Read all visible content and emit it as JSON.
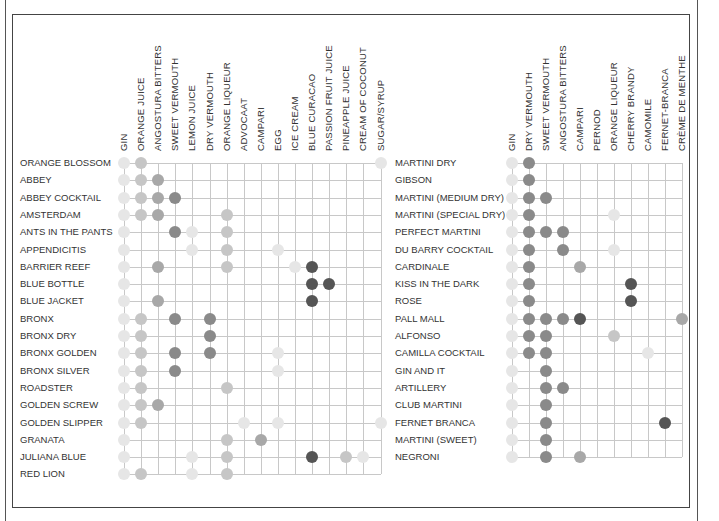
{
  "chart_data": [
    {
      "type": "heatmap",
      "title": "",
      "xlabel": "Ingredients",
      "ylabel": "Cocktails",
      "grid": true,
      "columns": [
        "GIN",
        "ORANGE JUICE",
        "ANGOSTURA BITTERS",
        "SWEET VERMOUTH",
        "LEMON JUICE",
        "DRY VERMOUTH",
        "ORANGE LIQUEUR",
        "ADVOCAAT",
        "CAMPARI",
        "EGG",
        "ICE CREAM",
        "BLUE CURACAO",
        "PASSION FRUIT JUICE",
        "PINEAPPLE JUICE",
        "CREAM OF COCONUT",
        "SUGAR/SYRUP"
      ],
      "rows": [
        {
          "label": "ORANGE BLOSSOM",
          "dots": [
            [
              0,
              1
            ],
            [
              1,
              2
            ],
            [
              15,
              1
            ]
          ]
        },
        {
          "label": "ABBEY",
          "dots": [
            [
              0,
              1
            ],
            [
              1,
              2
            ],
            [
              2,
              3
            ]
          ]
        },
        {
          "label": "ABBEY COCKTAIL",
          "dots": [
            [
              0,
              1
            ],
            [
              1,
              2
            ],
            [
              2,
              3
            ],
            [
              3,
              4
            ]
          ]
        },
        {
          "label": "AMSTERDAM",
          "dots": [
            [
              0,
              1
            ],
            [
              1,
              2
            ],
            [
              2,
              3
            ],
            [
              6,
              2
            ]
          ]
        },
        {
          "label": "ANTS IN THE PANTS",
          "dots": [
            [
              0,
              1
            ],
            [
              3,
              4
            ],
            [
              4,
              1
            ],
            [
              6,
              2
            ]
          ]
        },
        {
          "label": "APPENDICITIS",
          "dots": [
            [
              0,
              1
            ],
            [
              4,
              1
            ],
            [
              6,
              2
            ],
            [
              9,
              1
            ]
          ]
        },
        {
          "label": "BARRIER REEF",
          "dots": [
            [
              0,
              1
            ],
            [
              2,
              3
            ],
            [
              6,
              2
            ],
            [
              10,
              1
            ],
            [
              11,
              5
            ]
          ]
        },
        {
          "label": "BLUE BOTTLE",
          "dots": [
            [
              0,
              1
            ],
            [
              11,
              5
            ],
            [
              12,
              5
            ]
          ]
        },
        {
          "label": "BLUE JACKET",
          "dots": [
            [
              0,
              1
            ],
            [
              2,
              3
            ],
            [
              11,
              5
            ]
          ]
        },
        {
          "label": "BRONX",
          "dots": [
            [
              0,
              1
            ],
            [
              1,
              2
            ],
            [
              3,
              4
            ],
            [
              5,
              4
            ]
          ]
        },
        {
          "label": "BRONX DRY",
          "dots": [
            [
              0,
              1
            ],
            [
              1,
              2
            ],
            [
              5,
              4
            ]
          ]
        },
        {
          "label": "BRONX GOLDEN",
          "dots": [
            [
              0,
              1
            ],
            [
              1,
              2
            ],
            [
              3,
              4
            ],
            [
              5,
              4
            ],
            [
              9,
              1
            ]
          ]
        },
        {
          "label": "BRONX SILVER",
          "dots": [
            [
              0,
              1
            ],
            [
              1,
              2
            ],
            [
              3,
              4
            ],
            [
              9,
              1
            ]
          ]
        },
        {
          "label": "ROADSTER",
          "dots": [
            [
              0,
              1
            ],
            [
              1,
              2
            ],
            [
              6,
              2
            ]
          ]
        },
        {
          "label": "GOLDEN SCREW",
          "dots": [
            [
              0,
              1
            ],
            [
              1,
              2
            ],
            [
              2,
              3
            ]
          ]
        },
        {
          "label": "GOLDEN SLIPPER",
          "dots": [
            [
              0,
              1
            ],
            [
              1,
              2
            ],
            [
              7,
              1
            ],
            [
              9,
              1
            ],
            [
              15,
              1
            ]
          ]
        },
        {
          "label": "GRANATA",
          "dots": [
            [
              0,
              1
            ],
            [
              6,
              2
            ],
            [
              8,
              3
            ]
          ]
        },
        {
          "label": "JULIANA BLUE",
          "dots": [
            [
              0,
              1
            ],
            [
              4,
              1
            ],
            [
              6,
              2
            ],
            [
              11,
              5
            ],
            [
              13,
              2
            ],
            [
              14,
              1
            ]
          ]
        },
        {
          "label": "RED LION",
          "dots": [
            [
              0,
              1
            ],
            [
              1,
              2
            ],
            [
              4,
              1
            ],
            [
              6,
              2
            ]
          ]
        }
      ]
    },
    {
      "type": "heatmap",
      "title": "",
      "xlabel": "Ingredients",
      "ylabel": "Cocktails",
      "grid": true,
      "columns": [
        "GIN",
        "DRY VERMOUTH",
        "SWEET VERMOUTH",
        "ANGOSTURA BITTERS",
        "CAMPARI",
        "PERNOD",
        "ORANGE LIQUEUR",
        "CHERRY BRANDY",
        "CAMOMILE",
        "FERNET-BRANCA",
        "CRÈME DE MENTHE"
      ],
      "rows": [
        {
          "label": "MARTINI DRY",
          "dots": [
            [
              0,
              1
            ],
            [
              1,
              4
            ]
          ]
        },
        {
          "label": "GIBSON",
          "dots": [
            [
              0,
              1
            ],
            [
              1,
              4
            ]
          ]
        },
        {
          "label": "MARTINI (MEDIUM DRY)",
          "dots": [
            [
              0,
              1
            ],
            [
              1,
              4
            ],
            [
              2,
              4
            ]
          ]
        },
        {
          "label": "MARTINI (SPECIAL DRY)",
          "dots": [
            [
              0,
              1
            ],
            [
              1,
              4
            ],
            [
              6,
              1
            ]
          ]
        },
        {
          "label": "PERFECT MARTINI",
          "dots": [
            [
              0,
              1
            ],
            [
              1,
              4
            ],
            [
              2,
              4
            ],
            [
              3,
              4
            ]
          ]
        },
        {
          "label": "DU BARRY COCKTAIL",
          "dots": [
            [
              0,
              1
            ],
            [
              1,
              4
            ],
            [
              3,
              4
            ],
            [
              6,
              1
            ]
          ]
        },
        {
          "label": "CARDINALE",
          "dots": [
            [
              0,
              1
            ],
            [
              1,
              4
            ],
            [
              4,
              3
            ]
          ]
        },
        {
          "label": "KISS IN THE DARK",
          "dots": [
            [
              0,
              1
            ],
            [
              1,
              4
            ],
            [
              7,
              5
            ]
          ]
        },
        {
          "label": "ROSE",
          "dots": [
            [
              0,
              1
            ],
            [
              1,
              4
            ],
            [
              7,
              5
            ]
          ]
        },
        {
          "label": "PALL MALL",
          "dots": [
            [
              0,
              1
            ],
            [
              1,
              4
            ],
            [
              2,
              4
            ],
            [
              3,
              4
            ],
            [
              4,
              5
            ],
            [
              10,
              3
            ]
          ]
        },
        {
          "label": "ALFONSO",
          "dots": [
            [
              0,
              1
            ],
            [
              1,
              4
            ],
            [
              2,
              4
            ],
            [
              6,
              2
            ]
          ]
        },
        {
          "label": "CAMILLA COCKTAIL",
          "dots": [
            [
              0,
              1
            ],
            [
              1,
              4
            ],
            [
              2,
              4
            ],
            [
              8,
              1
            ]
          ]
        },
        {
          "label": "GIN AND IT",
          "dots": [
            [
              0,
              1
            ],
            [
              2,
              4
            ]
          ]
        },
        {
          "label": "ARTILLERY",
          "dots": [
            [
              0,
              1
            ],
            [
              2,
              4
            ],
            [
              3,
              4
            ]
          ]
        },
        {
          "label": "CLUB MARTINI",
          "dots": [
            [
              0,
              1
            ],
            [
              2,
              4
            ]
          ]
        },
        {
          "label": "FERNET BRANCA",
          "dots": [
            [
              0,
              1
            ],
            [
              2,
              4
            ],
            [
              9,
              5
            ]
          ]
        },
        {
          "label": "MARTINI (SWEET)",
          "dots": [
            [
              0,
              1
            ],
            [
              2,
              4
            ]
          ]
        },
        {
          "label": "NEGRONI",
          "dots": [
            [
              0,
              1
            ],
            [
              2,
              4
            ],
            [
              4,
              3
            ]
          ]
        }
      ]
    }
  ],
  "layout": {
    "left": {
      "col_x0": 124,
      "col_dx": 17.1,
      "row_y0": 163,
      "row_dy": 17.3,
      "label_x": 20
    },
    "right": {
      "col_x0": 512,
      "col_dx": 16.95,
      "row_y0": 163,
      "row_dy": 17.3,
      "label_x": 395
    }
  }
}
